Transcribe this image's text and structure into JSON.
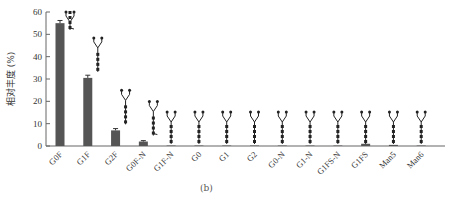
{
  "chart_data": {
    "type": "bar",
    "title": "",
    "xlabel": "",
    "ylabel": "相对丰度 (%)",
    "ylim": [
      0,
      60
    ],
    "yticks": [
      0,
      10,
      20,
      30,
      40,
      50,
      60
    ],
    "grid": false,
    "categories": [
      "G0F",
      "G1F",
      "G2F",
      "G0F-N",
      "G1F-N",
      "G0",
      "G1",
      "G2",
      "G0-N",
      "G1-N",
      "G1FS-N",
      "G1FS",
      "Man5",
      "Man6"
    ],
    "values": [
      55,
      30.5,
      7,
      2,
      0.2,
      0.2,
      0.2,
      0.2,
      0.2,
      0.2,
      0.2,
      1,
      0.5,
      0.2
    ],
    "error": [
      1.2,
      1.2,
      0.8,
      0.4,
      0.1,
      0.1,
      0.1,
      0.1,
      0.1,
      0.1,
      0.1,
      0.3,
      0.2,
      0.1
    ],
    "annotations": "glycan structure icons drawn above each bar"
  },
  "colors": {
    "bar": "#555555",
    "axis": "#666666"
  },
  "subfigure_label": "(b)",
  "caption": "图 ... 聚糖相对丰度"
}
